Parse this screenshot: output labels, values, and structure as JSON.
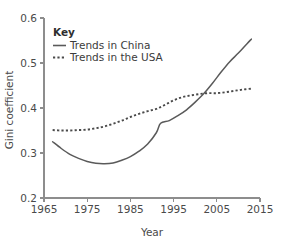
{
  "clipped_top_text": "",
  "chart_data": {
    "type": "line",
    "title": "",
    "xlabel": "Year",
    "ylabel": "Gini coefficient",
    "xlim": [
      1965,
      2015
    ],
    "ylim": [
      0.2,
      0.6
    ],
    "xticks": [
      1965,
      1975,
      1985,
      1995,
      2005,
      2015
    ],
    "xtick_labels": [
      "1965",
      "1975",
      "1985",
      "1995",
      "2005",
      "2015"
    ],
    "yticks": [
      0.2,
      0.3,
      0.4,
      0.5,
      0.6
    ],
    "ytick_labels": [
      "0.2",
      "0.3",
      "0.4",
      "0.5",
      "0.6"
    ],
    "grid": false,
    "legend_position": "upper-left-inside",
    "legend_title": "Key",
    "series": [
      {
        "name": "Trends in China",
        "style": "solid",
        "color": "#5a5a5a",
        "x": [
          1967,
          1969,
          1971,
          1973,
          1975,
          1977,
          1979,
          1981,
          1983,
          1985,
          1987,
          1989,
          1991,
          1992,
          1994,
          1996,
          1998,
          2000,
          2002,
          2004,
          2006,
          2008,
          2010,
          2012,
          2013
        ],
        "y": [
          0.325,
          0.31,
          0.297,
          0.288,
          0.281,
          0.277,
          0.276,
          0.278,
          0.284,
          0.292,
          0.304,
          0.32,
          0.345,
          0.366,
          0.372,
          0.383,
          0.396,
          0.413,
          0.432,
          0.455,
          0.48,
          0.503,
          0.522,
          0.543,
          0.553
        ]
      },
      {
        "name": "Trends in the USA",
        "style": "dotted",
        "color": "#4a4a4a",
        "x": [
          1967,
          1969,
          1971,
          1973,
          1975,
          1977,
          1979,
          1981,
          1983,
          1985,
          1987,
          1989,
          1991,
          1993,
          1995,
          1997,
          1999,
          2001,
          2003,
          2005,
          2007,
          2009,
          2011,
          2013
        ],
        "y": [
          0.351,
          0.35,
          0.35,
          0.351,
          0.352,
          0.355,
          0.359,
          0.365,
          0.372,
          0.38,
          0.387,
          0.393,
          0.398,
          0.407,
          0.417,
          0.424,
          0.428,
          0.431,
          0.433,
          0.433,
          0.435,
          0.438,
          0.441,
          0.443
        ]
      }
    ]
  }
}
